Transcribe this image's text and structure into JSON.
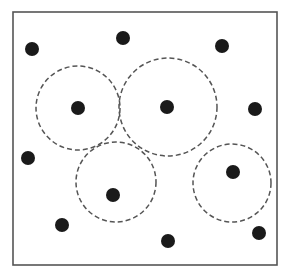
{
  "diagram": {
    "width": 297,
    "height": 278,
    "background": "#ffffff",
    "frame": {
      "x": 13,
      "y": 12,
      "width": 264,
      "height": 253,
      "stroke": "#555555",
      "stroke_width": 1.6
    },
    "dot_style": {
      "fill": "#1a1a1a",
      "radius": 7
    },
    "circle_style": {
      "stroke": "#555555",
      "stroke_width": 1.5,
      "dash": "5 3"
    },
    "dots": [
      {
        "id": "dot-1",
        "cx": 32,
        "cy": 49
      },
      {
        "id": "dot-2",
        "cx": 123,
        "cy": 38
      },
      {
        "id": "dot-3",
        "cx": 222,
        "cy": 46
      },
      {
        "id": "dot-4",
        "cx": 78,
        "cy": 108
      },
      {
        "id": "dot-5",
        "cx": 167,
        "cy": 107
      },
      {
        "id": "dot-6",
        "cx": 255,
        "cy": 109
      },
      {
        "id": "dot-7",
        "cx": 28,
        "cy": 158
      },
      {
        "id": "dot-8",
        "cx": 113,
        "cy": 195
      },
      {
        "id": "dot-9",
        "cx": 233,
        "cy": 172
      },
      {
        "id": "dot-10",
        "cx": 62,
        "cy": 225
      },
      {
        "id": "dot-11",
        "cx": 168,
        "cy": 241
      },
      {
        "id": "dot-12",
        "cx": 259,
        "cy": 233
      }
    ],
    "dashed_circles": [
      {
        "id": "circle-1",
        "cx": 78,
        "cy": 108,
        "r": 42
      },
      {
        "id": "circle-2",
        "cx": 168,
        "cy": 107,
        "r": 49
      },
      {
        "id": "circle-3",
        "cx": 116,
        "cy": 182,
        "r": 40
      },
      {
        "id": "circle-4",
        "cx": 232,
        "cy": 183,
        "r": 39
      }
    ]
  }
}
